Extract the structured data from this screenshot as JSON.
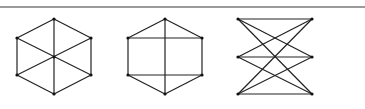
{
  "rule": {
    "color": "#9a9a9a"
  },
  "graphs": [
    {
      "name": "wheel-hexagon",
      "nodes": [
        [
          54,
          19
        ],
        [
          91,
          38
        ],
        [
          91,
          75
        ],
        [
          54,
          94
        ],
        [
          17,
          75
        ],
        [
          17,
          38
        ],
        [
          54,
          57
        ]
      ],
      "edges": [
        [
          0,
          1
        ],
        [
          1,
          2
        ],
        [
          2,
          3
        ],
        [
          3,
          4
        ],
        [
          4,
          5
        ],
        [
          5,
          0
        ],
        [
          0,
          3
        ],
        [
          1,
          4
        ],
        [
          2,
          5
        ]
      ]
    },
    {
      "name": "hexagon-with-cross",
      "nodes": [
        [
          165,
          19
        ],
        [
          202,
          38
        ],
        [
          202,
          75
        ],
        [
          165,
          94
        ],
        [
          128,
          75
        ],
        [
          128,
          38
        ]
      ],
      "edges": [
        [
          0,
          1
        ],
        [
          1,
          2
        ],
        [
          2,
          3
        ],
        [
          3,
          4
        ],
        [
          4,
          5
        ],
        [
          5,
          0
        ],
        [
          0,
          3
        ],
        [
          5,
          1
        ],
        [
          4,
          2
        ]
      ]
    },
    {
      "name": "k33-bipartite",
      "nodes": [
        [
          238,
          19
        ],
        [
          238,
          57
        ],
        [
          238,
          94
        ],
        [
          312,
          19
        ],
        [
          312,
          57
        ],
        [
          312,
          94
        ]
      ],
      "edges": [
        [
          0,
          3
        ],
        [
          0,
          4
        ],
        [
          0,
          5
        ],
        [
          1,
          3
        ],
        [
          1,
          4
        ],
        [
          1,
          5
        ],
        [
          2,
          3
        ],
        [
          2,
          4
        ],
        [
          2,
          5
        ]
      ]
    }
  ],
  "style": {
    "edge_color": "#222222",
    "node_color": "#111111"
  }
}
